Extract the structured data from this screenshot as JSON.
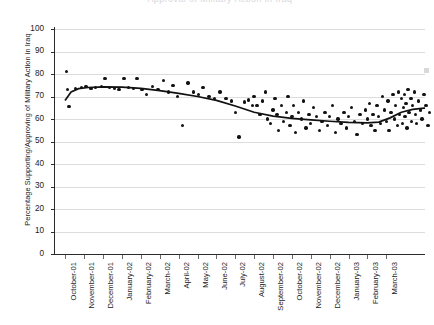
{
  "chart": {
    "title_clipped": "Approval of Military Action in Iraq",
    "y_axis_title": "Percentage Supporting/Approving of Military Action in Iraq"
  },
  "chart_data": {
    "type": "scatter",
    "title": "Approval of Military Action in Iraq",
    "xlabel": "",
    "ylabel": "Percentage Supporting/Approving of Military Action in Iraq",
    "ylim": [
      0,
      100
    ],
    "yticks": [
      0,
      10,
      20,
      30,
      40,
      50,
      60,
      70,
      80,
      90,
      100
    ],
    "grid": true,
    "legend": "none",
    "categories": [
      "October-01",
      "November-01",
      "December-01",
      "January-02",
      "February-02",
      "March-02",
      "April-02",
      "May-02",
      "June-02",
      "July-02",
      "August-02",
      "September-02",
      "October-02",
      "November-02",
      "December-02",
      "January-03",
      "February-03",
      "March-03"
    ],
    "series": [
      {
        "name": "Poll readings",
        "type": "scatter",
        "points": [
          [
            0.05,
            81
          ],
          [
            0.12,
            73
          ],
          [
            0.2,
            65.5
          ],
          [
            0.55,
            73.5
          ],
          [
            0.85,
            74
          ],
          [
            1.1,
            74.5
          ],
          [
            1.35,
            73.5
          ],
          [
            1.6,
            74
          ],
          [
            1.9,
            74.5
          ],
          [
            2.1,
            78
          ],
          [
            2.35,
            74
          ],
          [
            2.6,
            73.5
          ],
          [
            2.85,
            73
          ],
          [
            3.1,
            78
          ],
          [
            3.35,
            74
          ],
          [
            3.6,
            73.5
          ],
          [
            3.8,
            78
          ],
          [
            4.05,
            73
          ],
          [
            4.3,
            71
          ],
          [
            4.6,
            74.5
          ],
          [
            4.9,
            73
          ],
          [
            5.2,
            77
          ],
          [
            5.45,
            72
          ],
          [
            5.7,
            75
          ],
          [
            5.95,
            70
          ],
          [
            6.2,
            57
          ],
          [
            6.5,
            76
          ],
          [
            6.8,
            72
          ],
          [
            7.05,
            71
          ],
          [
            7.3,
            74
          ],
          [
            7.6,
            70
          ],
          [
            7.9,
            69
          ],
          [
            8.2,
            72
          ],
          [
            8.5,
            69
          ],
          [
            8.8,
            68
          ],
          [
            9.0,
            63
          ],
          [
            9.2,
            52
          ],
          [
            9.5,
            67.5
          ],
          [
            9.7,
            68.5
          ],
          [
            9.9,
            66
          ],
          [
            10.0,
            70
          ],
          [
            10.15,
            66
          ],
          [
            10.3,
            62
          ],
          [
            10.45,
            68
          ],
          [
            10.6,
            72
          ],
          [
            10.7,
            60
          ],
          [
            10.85,
            58
          ],
          [
            11.0,
            64
          ],
          [
            11.1,
            69
          ],
          [
            11.2,
            62
          ],
          [
            11.3,
            55
          ],
          [
            11.45,
            66
          ],
          [
            11.55,
            59
          ],
          [
            11.7,
            63
          ],
          [
            11.8,
            70
          ],
          [
            11.9,
            57
          ],
          [
            12.0,
            61
          ],
          [
            12.1,
            66
          ],
          [
            12.2,
            54
          ],
          [
            12.35,
            63
          ],
          [
            12.5,
            60
          ],
          [
            12.6,
            68
          ],
          [
            12.75,
            56
          ],
          [
            12.9,
            62
          ],
          [
            13.0,
            58
          ],
          [
            13.15,
            65
          ],
          [
            13.3,
            61
          ],
          [
            13.45,
            55
          ],
          [
            13.6,
            59
          ],
          [
            13.75,
            63
          ],
          [
            13.9,
            57
          ],
          [
            14.0,
            61
          ],
          [
            14.15,
            66
          ],
          [
            14.3,
            54
          ],
          [
            14.45,
            60
          ],
          [
            14.6,
            58
          ],
          [
            14.75,
            63
          ],
          [
            14.9,
            56
          ],
          [
            15.0,
            61
          ],
          [
            15.15,
            65
          ],
          [
            15.3,
            59
          ],
          [
            15.45,
            53
          ],
          [
            15.6,
            62
          ],
          [
            15.75,
            58
          ],
          [
            15.9,
            64
          ],
          [
            16.0,
            60
          ],
          [
            16.1,
            67
          ],
          [
            16.2,
            57
          ],
          [
            16.3,
            62
          ],
          [
            16.4,
            55
          ],
          [
            16.5,
            66
          ],
          [
            16.6,
            61
          ],
          [
            16.7,
            58
          ],
          [
            16.8,
            70
          ],
          [
            16.9,
            64
          ],
          [
            17.0,
            59
          ],
          [
            17.1,
            68
          ],
          [
            17.15,
            55
          ],
          [
            17.25,
            63
          ],
          [
            17.35,
            71
          ],
          [
            17.45,
            60
          ],
          [
            17.5,
            66
          ],
          [
            17.6,
            57
          ],
          [
            17.65,
            72
          ],
          [
            17.7,
            62
          ],
          [
            17.8,
            69
          ],
          [
            17.85,
            58
          ],
          [
            17.9,
            65
          ],
          [
            17.95,
            71
          ],
          [
            18.0,
            61
          ],
          [
            18.05,
            67
          ],
          [
            18.1,
            56
          ],
          [
            18.15,
            73
          ],
          [
            18.2,
            63
          ],
          [
            18.3,
            69
          ],
          [
            18.35,
            59
          ],
          [
            18.4,
            66
          ],
          [
            18.5,
            72
          ],
          [
            18.55,
            62
          ],
          [
            18.6,
            58
          ],
          [
            18.7,
            68
          ],
          [
            18.8,
            64
          ],
          [
            18.9,
            60
          ],
          [
            19.0,
            71
          ],
          [
            19.1,
            66
          ],
          [
            19.2,
            57
          ],
          [
            19.3,
            63
          ]
        ]
      },
      {
        "name": "Smoothed trend",
        "type": "line",
        "points": [
          [
            0.0,
            68.5
          ],
          [
            0.3,
            72.0
          ],
          [
            0.7,
            73.5
          ],
          [
            1.2,
            74.0
          ],
          [
            2.0,
            74.3
          ],
          [
            3.0,
            74.2
          ],
          [
            4.0,
            73.6
          ],
          [
            5.0,
            72.6
          ],
          [
            6.0,
            71.4
          ],
          [
            7.0,
            70.0
          ],
          [
            8.0,
            68.3
          ],
          [
            9.0,
            65.8
          ],
          [
            10.0,
            63.0
          ],
          [
            11.0,
            61.3
          ],
          [
            12.0,
            60.3
          ],
          [
            13.0,
            59.6
          ],
          [
            14.0,
            59.0
          ],
          [
            15.0,
            58.5
          ],
          [
            16.0,
            58.3
          ],
          [
            16.6,
            58.6
          ],
          [
            17.2,
            60.5
          ],
          [
            17.8,
            63.0
          ],
          [
            18.4,
            64.3
          ],
          [
            19.0,
            64.8
          ],
          [
            19.4,
            64.9
          ]
        ]
      }
    ]
  }
}
